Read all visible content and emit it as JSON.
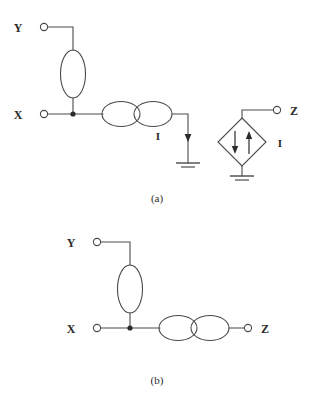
{
  "figure": {
    "type": "circuit-diagram",
    "background_color": "#ffffff",
    "line_color": "#4a4a4a",
    "text_color": "#2b2b2b"
  },
  "panel_a": {
    "caption": "(a)",
    "terminals": [
      {
        "id": "y",
        "label": "Y"
      },
      {
        "id": "x",
        "label": "X"
      },
      {
        "id": "z",
        "label": "Z"
      }
    ],
    "current_label_left": "I",
    "current_label_right": "I",
    "components": {
      "vertical_ellipse": "impedance-element",
      "coupled_ellipses": "coupled-element",
      "current_source": "dependent-current-source",
      "ground_left": "ground-symbol",
      "ground_right": "ground-symbol"
    }
  },
  "panel_b": {
    "caption": "(b)",
    "terminals": [
      {
        "id": "y",
        "label": "Y"
      },
      {
        "id": "x",
        "label": "X"
      },
      {
        "id": "z",
        "label": "Z"
      }
    ],
    "components": {
      "vertical_ellipse": "impedance-element",
      "coupled_ellipses": "coupled-element"
    }
  }
}
